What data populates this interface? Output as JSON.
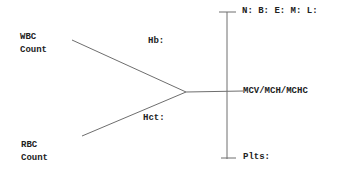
{
  "diagram": {
    "type": "lab-fishbone",
    "line_color": "#6e6e6e",
    "text_color": "#222222",
    "left": {
      "wbc_label_line1": "WBC",
      "wbc_label_line2": "Count",
      "rbc_label_line1": "RBC",
      "rbc_label_line2": "Count",
      "hb_label": "Hb:",
      "hct_label": "Hct:"
    },
    "right": {
      "differential_label": "N: B: E: M: L:",
      "indices_label": "MCV/MCH/MCHC",
      "platelets_label": "Plts:"
    }
  }
}
